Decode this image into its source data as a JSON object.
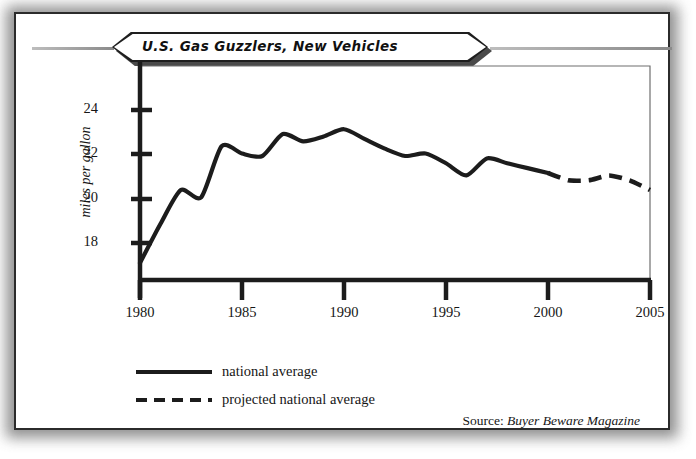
{
  "title": "U.S. Gas Guzzlers, New Vehicles",
  "source": {
    "prefix": "Source:",
    "publication": "Buyer Beware Magazine"
  },
  "legend": [
    {
      "label": "national average",
      "style": "solid",
      "color": "#1c1c1c"
    },
    {
      "label": "projected national average",
      "style": "dashed",
      "color": "#1c1c1c"
    }
  ],
  "colors": {
    "line": "#1c1c1c",
    "axis": "#1c1c1c",
    "frame": "#2b2b2b",
    "text": "#161616",
    "background": "#ffffff"
  },
  "chart_data": {
    "type": "line",
    "title": "U.S. Gas Guzzlers, New Vehicles",
    "xlabel": "",
    "ylabel": "miles per gallon",
    "xlim": [
      1980,
      2005
    ],
    "ylim": [
      16.4,
      25.2
    ],
    "xticks": [
      1980,
      1985,
      1990,
      1995,
      2000,
      2005
    ],
    "yticks": [
      18,
      20,
      22,
      24
    ],
    "grid": false,
    "legend_position": "below-axes-left",
    "series": [
      {
        "name": "national average",
        "style": "solid",
        "x": [
          1980,
          1981,
          1982,
          1983,
          1984,
          1985,
          1986,
          1987,
          1988,
          1989,
          1990,
          1991,
          1992,
          1993,
          1994,
          1995,
          1996,
          1997,
          1998,
          1999,
          2000
        ],
        "values": [
          17.1,
          18.7,
          20.1,
          19.8,
          21.9,
          21.6,
          21.5,
          22.4,
          22.1,
          22.3,
          22.6,
          22.2,
          21.8,
          21.5,
          21.6,
          21.2,
          20.7,
          21.4,
          21.2,
          21.0,
          20.8
        ]
      },
      {
        "name": "projected national average",
        "style": "dashed",
        "x": [
          2000,
          2001,
          2002,
          2003,
          2004,
          2005
        ],
        "values": [
          20.8,
          20.5,
          20.5,
          20.7,
          20.5,
          20.1
        ]
      }
    ]
  }
}
